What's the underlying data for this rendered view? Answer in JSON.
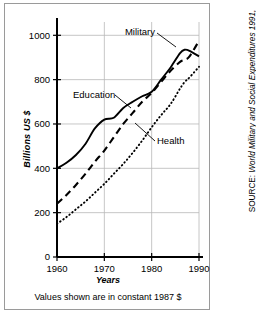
{
  "figure": {
    "caption": "Values shown are in constant 1987 $",
    "source_prefix": "SOURCE: ",
    "source_title": "World Military and Social Expenditures 1991,",
    "source_author": "Ruth Leger Sivard"
  },
  "chart_data": {
    "type": "line",
    "title": "",
    "xlabel": "Years",
    "ylabel": "Billions US $",
    "xlim": [
      1960,
      1990
    ],
    "ylim": [
      0,
      1060
    ],
    "xticks": [
      1960,
      1970,
      1980,
      1990
    ],
    "yticks": [
      0,
      200,
      400,
      600,
      800,
      1000
    ],
    "grid": true,
    "legend": "inline-annotations",
    "annotations": [
      {
        "label": "Military",
        "series": "Military"
      },
      {
        "label": "Education",
        "series": "Education"
      },
      {
        "label": "Health",
        "series": "Health"
      }
    ],
    "x": [
      1960,
      1962,
      1964,
      1966,
      1968,
      1970,
      1972,
      1974,
      1976,
      1978,
      1980,
      1982,
      1984,
      1986,
      1987,
      1988,
      1990
    ],
    "series": [
      {
        "name": "Education",
        "style": "solid",
        "values": [
          400,
          425,
          460,
          510,
          580,
          620,
          628,
          672,
          700,
          725,
          745,
          800,
          855,
          920,
          935,
          930,
          905
        ]
      },
      {
        "name": "Military",
        "style": "dashed",
        "values": [
          240,
          280,
          325,
          375,
          430,
          480,
          540,
          600,
          650,
          700,
          740,
          790,
          840,
          880,
          890,
          905,
          975
        ]
      },
      {
        "name": "Health",
        "style": "dotted",
        "values": [
          150,
          180,
          215,
          250,
          290,
          330,
          375,
          420,
          470,
          525,
          585,
          640,
          690,
          760,
          790,
          810,
          858
        ]
      }
    ]
  }
}
